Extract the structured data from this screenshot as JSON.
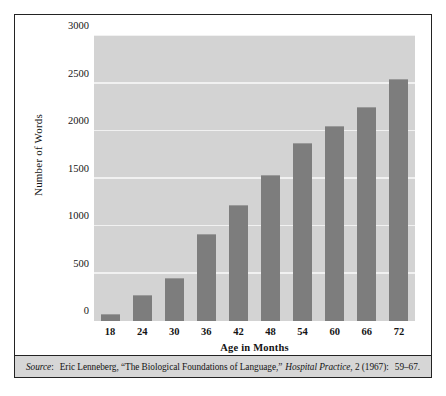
{
  "figure": {
    "source_prefix": "Source",
    "source_colon": ":",
    "source_author": "Eric Lenneberg, “The Biological Foundations of Language,”",
    "source_journal": "Hospital Practice",
    "source_rest": ", 2 (1967):",
    "source_pages": "59–67."
  },
  "colors": {
    "plot_background": "#d3d3d3",
    "bar_fill": "#7d7d7d",
    "gridline": "#f1f1f1",
    "frame": "#232323",
    "footer_background": "#d6d6d6"
  },
  "chart_data": {
    "type": "bar",
    "title": "",
    "xlabel": "Age in Months",
    "ylabel": "Number of Words",
    "categories": [
      "18",
      "24",
      "30",
      "36",
      "42",
      "48",
      "54",
      "60",
      "66",
      "72"
    ],
    "values": [
      70,
      270,
      450,
      920,
      1220,
      1540,
      1870,
      2050,
      2250,
      2550
    ],
    "ylim": [
      0,
      3000
    ],
    "yticks": [
      0,
      500,
      1000,
      1500,
      2000,
      2500,
      3000
    ],
    "ytick_labels": [
      "0",
      "500",
      "1000",
      "1500",
      "2000",
      "2500",
      "3000"
    ],
    "grid": true,
    "legend": "none"
  }
}
